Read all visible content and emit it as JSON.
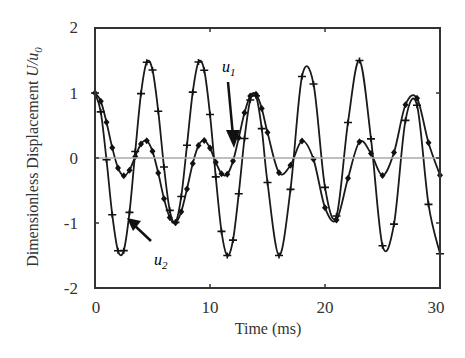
{
  "chart_data": {
    "type": "line",
    "title": "",
    "xlabel": "Time (ms)",
    "ylabel": "Dimensionless Displacement  U/u0",
    "xlim": [
      0,
      30
    ],
    "ylim": [
      -2,
      2
    ],
    "xticks": [
      "0",
      "10",
      "20",
      "30"
    ],
    "yticks": [
      "2",
      "1",
      "0",
      "-1",
      "-2"
    ],
    "grid": false,
    "zero_line": true,
    "legend": "none",
    "annotations": [
      {
        "text": "u1",
        "arrow_to_t": 12,
        "arrow_to_y": 0.2
      },
      {
        "text": "u2",
        "arrow_to_t": 2.6,
        "arrow_to_y": -1.0
      }
    ],
    "x": [
      0,
      0.5,
      1,
      1.5,
      2,
      2.5,
      3,
      3.5,
      4,
      4.5,
      5,
      5.5,
      6,
      6.5,
      7,
      7.5,
      8,
      8.5,
      9,
      9.5,
      10,
      10.5,
      11,
      11.5,
      12,
      12.5,
      13,
      13.5,
      14,
      14.5,
      15,
      16,
      17,
      18,
      19,
      20,
      21,
      22,
      23,
      24,
      25,
      26,
      27,
      28,
      29,
      30
    ],
    "series": [
      {
        "name": "u1",
        "marker": "diamond",
        "values": [
          1,
          0.875,
          0.551,
          0.158,
          -0.152,
          -0.273,
          -0.187,
          0.023,
          0.217,
          0.266,
          0.102,
          -0.232,
          -0.626,
          -0.916,
          -0.995,
          -0.825,
          -0.475,
          -0.086,
          0.193,
          0.271,
          0.152,
          -0.066,
          -0.242,
          -0.25,
          -0.048,
          0.311,
          0.695,
          0.954,
          0.981,
          0.763,
          0.394,
          -0.226,
          -0.111,
          0.262,
          -0.021,
          -0.764,
          -0.954,
          -0.313,
          0.25,
          0.068,
          -0.27,
          0.084,
          0.819,
          0.919,
          0.235,
          -0.265
        ]
      },
      {
        "name": "u2",
        "marker": "plus",
        "values": [
          1,
          0.71,
          -0.028,
          -0.872,
          -1.427,
          -1.425,
          -0.837,
          0.099,
          0.991,
          1.474,
          1.353,
          0.72,
          -0.139,
          -0.805,
          -0.99,
          -0.592,
          0.197,
          1.013,
          1.476,
          1.351,
          0.67,
          -0.29,
          -1.129,
          -1.5,
          -1.263,
          -0.549,
          0.3,
          0.893,
          0.956,
          0.452,
          -0.376,
          -1.5,
          -0.483,
          1.254,
          1.139,
          -0.452,
          -0.893,
          0.547,
          1.5,
          0.294,
          -1.349,
          -1.017,
          0.579,
          0.812,
          -0.713,
          -1.473
        ]
      }
    ]
  },
  "colors": {
    "line": "#1a1a1a",
    "axis": "#333333",
    "zero_line": "#aaaaaa"
  }
}
